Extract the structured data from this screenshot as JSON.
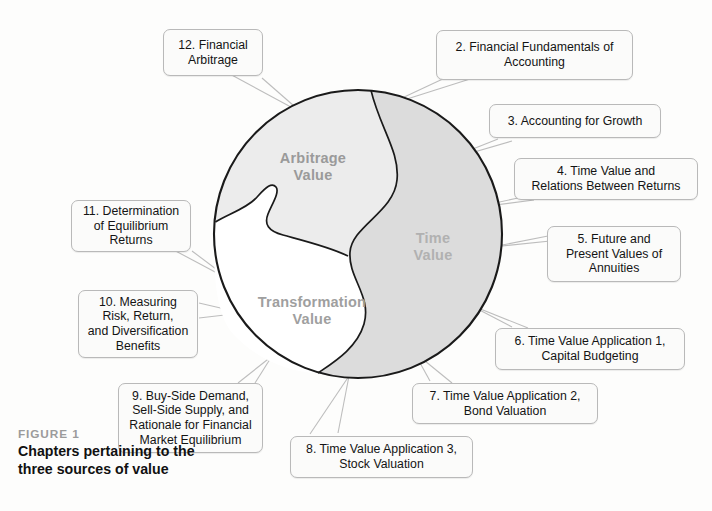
{
  "figure": {
    "kicker": "FIGURE 1"
  },
  "diagram": {
    "type": "venn-circle-three-regions",
    "shape": "circle divided into three irregular regions",
    "regions": [
      {
        "id": "arbitrage-value",
        "label": "Arbitrage\nValue",
        "fill": "#ececec",
        "text_color": "#9a9a9a"
      },
      {
        "id": "time-value",
        "label": "Time\nValue",
        "fill": "#dcdcdc",
        "text_color": "#b1b1b1"
      },
      {
        "id": "transformation-value",
        "label": "Transformation\nValue",
        "fill": "#ffffff",
        "text_color": "#9f9f9f"
      }
    ]
  },
  "callouts": [
    {
      "id": "ch12",
      "text": "12. Financial\nArbitrage"
    },
    {
      "id": "ch2",
      "text": "2. Financial Fundamentals of\nAccounting"
    },
    {
      "id": "ch3",
      "text": "3. Accounting for Growth"
    },
    {
      "id": "ch4",
      "text": "4. Time Value and\nRelations Between Returns"
    },
    {
      "id": "ch5",
      "text": "5. Future and\nPresent Values of\nAnnuities"
    },
    {
      "id": "ch6",
      "text": "6. Time Value Application 1,\nCapital Budgeting"
    },
    {
      "id": "ch7",
      "text": "7. Time Value Application 2,\nBond Valuation"
    },
    {
      "id": "ch8",
      "text": "8. Time Value Application 3,\nStock Valuation"
    },
    {
      "id": "ch9",
      "text": "9. Buy-Side Demand,\nSell-Side Supply, and\nRationale for Financial\nMarket Equilibrium"
    },
    {
      "id": "ch10",
      "text": "10. Measuring\nRisk, Return,\nand Diversification\nBenefits"
    },
    {
      "id": "ch11",
      "text": "11. Determination\nof Equilibrium\nReturns"
    }
  ],
  "colors": {
    "outline": "#1a1a1a",
    "leader_line": "#b8b8b8",
    "callout_border": "#b9b9b9",
    "callout_fill": "#fbfbfa",
    "page_background": "#fdfdfc"
  }
}
